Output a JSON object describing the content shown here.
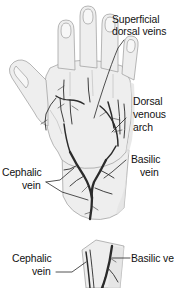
{
  "figure": {
    "panels": [
      {
        "id": "panel-hand-forearm",
        "name": "dorsum-of-hand-and-forearm"
      },
      {
        "id": "panel-forearm-detail",
        "name": "forearm-detail"
      }
    ]
  },
  "labels": {
    "superficial_dorsal_veins": {
      "line1": "Superficial",
      "line2": "dorsal veins"
    },
    "dorsal_venous_arch": {
      "line1": "Dorsal",
      "line2": "venous",
      "line3": "arch"
    },
    "basilic_vein_upper": {
      "line1": "Basilic",
      "line2": "vein"
    },
    "cephalic_vein_upper": {
      "line1": "Cephalic",
      "line2": "vein"
    },
    "cephalic_vein_lower": {
      "line1": "Cephalic",
      "line2": "vein"
    },
    "basilic_vein_lower": {
      "line1": "Basilic vein"
    }
  },
  "colors": {
    "text": "#111111",
    "leader_line": "#1a1a1a",
    "skin_fill": "#eeeeee",
    "skin_outline": "#9a9a9a",
    "vein": "#2b2b2b",
    "background": "#ffffff"
  }
}
